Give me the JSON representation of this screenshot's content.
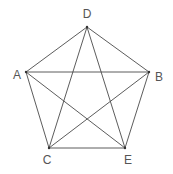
{
  "diagram": {
    "type": "complete-graph-pentagon",
    "stroke_color": "#4a4a4a",
    "label_color": "#555555",
    "vertices": [
      {
        "id": "D",
        "label": "D",
        "x": 87,
        "y": 27,
        "lx": 87,
        "ly": 18
      },
      {
        "id": "A",
        "label": "A",
        "x": 26,
        "y": 72,
        "lx": 17,
        "ly": 79
      },
      {
        "id": "B",
        "label": "B",
        "x": 149,
        "y": 72,
        "lx": 159,
        "ly": 81
      },
      {
        "id": "C",
        "label": "C",
        "x": 49,
        "y": 148,
        "lx": 47,
        "ly": 164
      },
      {
        "id": "E",
        "label": "E",
        "x": 125,
        "y": 148,
        "lx": 128,
        "ly": 164
      }
    ],
    "edges": [
      [
        "D",
        "A"
      ],
      [
        "D",
        "B"
      ],
      [
        "D",
        "C"
      ],
      [
        "D",
        "E"
      ],
      [
        "A",
        "B"
      ],
      [
        "A",
        "C"
      ],
      [
        "A",
        "E"
      ],
      [
        "B",
        "C"
      ],
      [
        "B",
        "E"
      ],
      [
        "C",
        "E"
      ]
    ]
  }
}
